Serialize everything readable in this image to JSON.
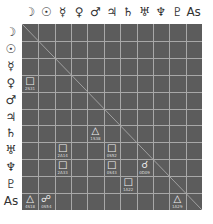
{
  "planets": [
    "☽",
    "☉",
    "☿",
    "♀",
    "♂",
    "♃",
    "♄",
    "♅",
    "♆",
    "♇",
    "As"
  ],
  "planet_names": [
    "moon",
    "sun",
    "mercury",
    "venus",
    "mars",
    "jupiter",
    "saturn",
    "uranus",
    "neptune",
    "pluto",
    "ascendant"
  ],
  "colors": {
    "grid_bg": "#5c5c5c",
    "grid_line": "#a8a8a8",
    "text": "#333333",
    "aspect": "#f0f0f0"
  },
  "aspects": [
    {
      "row": 3,
      "col": 0,
      "symbol": "□",
      "name": "square",
      "value": "2S31"
    },
    {
      "row": 6,
      "col": 4,
      "symbol": "△",
      "name": "trine",
      "value": "1S38"
    },
    {
      "row": 7,
      "col": 2,
      "symbol": "□",
      "name": "square",
      "value": "2A14"
    },
    {
      "row": 7,
      "col": 5,
      "symbol": "□",
      "name": "square",
      "value": "0S52"
    },
    {
      "row": 8,
      "col": 2,
      "symbol": "□",
      "name": "square",
      "value": "2A33"
    },
    {
      "row": 8,
      "col": 5,
      "symbol": "□",
      "name": "square",
      "value": "0S43"
    },
    {
      "row": 8,
      "col": 7,
      "symbol": "☌",
      "name": "conjunction",
      "value": "0D09"
    },
    {
      "row": 9,
      "col": 6,
      "symbol": "□",
      "name": "square",
      "value": "1A22"
    },
    {
      "row": 10,
      "col": 0,
      "symbol": "△",
      "name": "trine",
      "value": "4S18"
    },
    {
      "row": 10,
      "col": 1,
      "symbol": "☍",
      "name": "opposition",
      "value": "0S54"
    },
    {
      "row": 10,
      "col": 9,
      "symbol": "△",
      "name": "trine",
      "value": "1A29"
    }
  ]
}
